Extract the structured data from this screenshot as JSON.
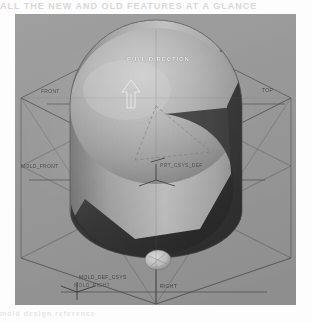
{
  "page": {
    "background_color": "#fdfdfd",
    "bleed_text_top": "ALL THE NEW AND OLD FEATURES AT A GLANCE",
    "bleed_text_bottom": "mold design reference"
  },
  "viewport": {
    "name": "cad-graphics-window",
    "background_color": "#9a9a9a",
    "x": 15,
    "y": 14,
    "width": 281,
    "height": 291
  },
  "model": {
    "type": "mold-cavity-cylinder",
    "light_surface_color": "#b9b9b9",
    "mid_surface_color": "#8d8d8d",
    "dark_surface_color": "#3d3d3d",
    "shadow_color": "#2a2a2a",
    "highlight_color": "#d6d6d6",
    "hole_color": "#dcdcdc"
  },
  "datum_planes": {
    "line_color": "#5d5d5d",
    "dashed_color": "#6a6a6a",
    "labels": [
      {
        "id": "front",
        "text": "FRONT",
        "x": 41,
        "y": 89
      },
      {
        "id": "top",
        "text": "TOP",
        "x": 262,
        "y": 88
      },
      {
        "id": "mold-front",
        "text": "MOLD_FRONT",
        "x": 21,
        "y": 163
      },
      {
        "id": "right",
        "text": "RIGHT",
        "x": 160,
        "y": 283
      }
    ]
  },
  "coordinate_systems": [
    {
      "id": "prt-csys-def",
      "text": "PRT_CSYS_DEF",
      "x": 160,
      "y": 162
    },
    {
      "id": "mold-def-csys",
      "text": "MOLD_DEF_CSYS",
      "x": 79,
      "y": 274
    },
    {
      "id": "mold-right",
      "text": "MOLD_RIGHT",
      "x": 74,
      "y": 282
    }
  ],
  "annotations": [
    {
      "id": "pull-direction",
      "text": "PULL DIRECTION",
      "x": 127,
      "y": 56
    }
  ]
}
